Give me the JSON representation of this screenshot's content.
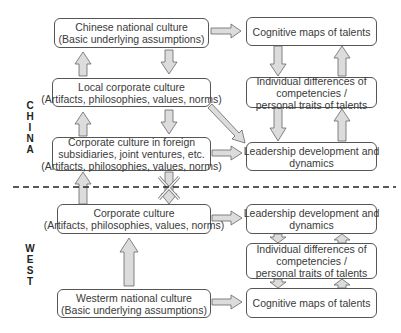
{
  "regions": {
    "china": {
      "label": "CHINA",
      "letters": [
        "C",
        "H",
        "I",
        "N",
        "A"
      ]
    },
    "west": {
      "label": "WEST",
      "letters": [
        "W",
        "E",
        "S",
        "T"
      ]
    }
  },
  "china": {
    "national_culture": {
      "line1": "Chinese national culture",
      "line2": "(Basic underlying assumptions)"
    },
    "local_corporate": {
      "line1": "Local corporate culture",
      "line2": "(Artifacts, philosophies, values, norms)"
    },
    "foreign_corporate": {
      "line1": "Corporate culture in foreign",
      "line2": "subsidiaries, joint ventures, etc.",
      "line3": "(Artifacts, philosophies, values, norms)"
    },
    "cognitive_maps": {
      "line1": "Cognitive maps of talents"
    },
    "individual_differences": {
      "line1": "Individual differences of",
      "line2": "competencies /",
      "line3": "personal traits of talents"
    },
    "leadership": {
      "line1": "Leadership development and",
      "line2": "dynamics"
    }
  },
  "west": {
    "corporate": {
      "line1": "Corporate culture",
      "line2": "(Artifacts, philosophies, values, norms)"
    },
    "national_culture": {
      "line1": "Westerm national culture",
      "line2": "(Basic underlying assumptions)"
    },
    "leadership": {
      "line1": "Leadership development and",
      "line2": "dynamics"
    },
    "individual_differences": {
      "line1": "Individual differences of",
      "line2": "competencies /",
      "line3": "personal traits of talents"
    },
    "cognitive_maps": {
      "line1": "Cognitive maps of talents"
    }
  },
  "colors": {
    "arrow_fill": "#d9d9d9",
    "arrow_stroke": "#666666",
    "border": "#555555",
    "dashed_line": "#222222"
  }
}
